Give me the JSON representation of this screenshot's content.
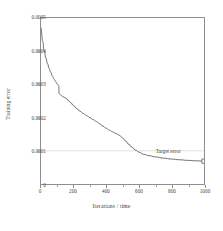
{
  "chart_data": {
    "type": "line",
    "title": "",
    "xlabel": "Iterations / time",
    "ylabel": "Training error",
    "xlim": [
      0,
      1000
    ],
    "ylim": [
      0,
      0.0005
    ],
    "grid": false,
    "legend": null,
    "xticks": [
      0,
      200,
      400,
      600,
      800,
      1000
    ],
    "xticklabels": [
      "0",
      "200",
      "400",
      "600",
      "800",
      "1000"
    ],
    "yticks": [
      0,
      0.0001,
      0.0002,
      0.0003,
      0.0004,
      0.0005
    ],
    "yticklabels": [
      "0",
      "0.0001",
      "0.0002",
      "0.0003",
      "0.0004",
      "0.0005"
    ],
    "series": [
      {
        "name": "Training error",
        "color": "#555555",
        "x": [
          0,
          10,
          20,
          30,
          40,
          50,
          60,
          70,
          80,
          90,
          100,
          108,
          112,
          120,
          135,
          150,
          165,
          180,
          200,
          220,
          240,
          260,
          280,
          300,
          320,
          340,
          360,
          380,
          400,
          420,
          440,
          460,
          480,
          500,
          520,
          540,
          560,
          580,
          600,
          630,
          660,
          700,
          750,
          800,
          850,
          900,
          950,
          1000
        ],
        "y": [
          0.000472,
          0.00043,
          0.0004,
          0.000379,
          0.000362,
          0.000348,
          0.000336,
          0.000325,
          0.000316,
          0.000308,
          0.000301,
          0.000297,
          0.000272,
          0.000268,
          0.000263,
          0.000259,
          0.000253,
          0.000246,
          0.000236,
          0.000227,
          0.000219,
          0.000212,
          0.000206,
          0.0002,
          0.000194,
          0.000188,
          0.000181,
          0.000174,
          0.000168,
          0.000162,
          0.000157,
          0.000152,
          0.000147,
          0.000139,
          0.000129,
          0.000119,
          0.00011,
          0.000102,
          9.6e-05,
          8.95e-05,
          8.55e-05,
          8.18e-05,
          7.8e-05,
          7.52e-05,
          7.3e-05,
          7.12e-05,
          6.98e-05,
          6.88e-05
        ]
      }
    ],
    "reference_lines": [
      {
        "name": "target-error-line",
        "orientation": "horizontal",
        "value": 0.0001,
        "color": "#dcdcdc"
      }
    ],
    "annotations": [
      {
        "name": "target-error",
        "text": "Target error",
        "x": 810,
        "y": 8.2e-05
      }
    ],
    "markers": [
      {
        "name": "endpoint-marker",
        "x": 1000,
        "y": 6.88e-05
      }
    ]
  }
}
